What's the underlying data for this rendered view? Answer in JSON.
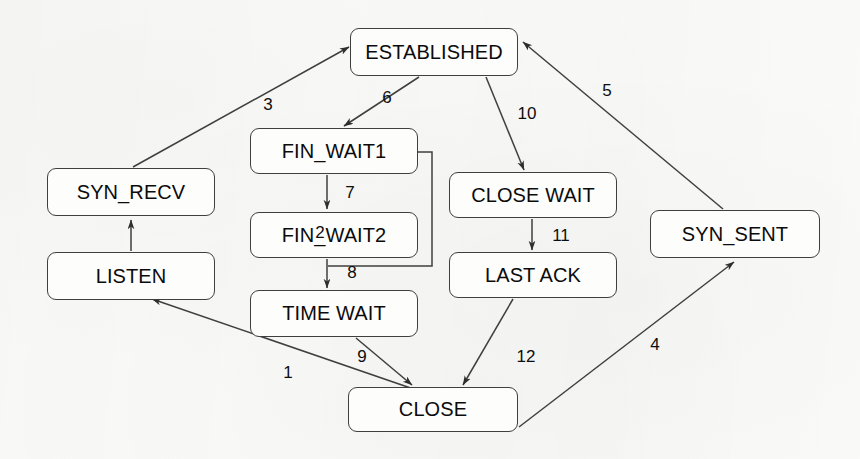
{
  "diagram": {
    "background_color": "#fafaf9",
    "line_color": "#3f3f3f",
    "text_color": "#0b0b0b",
    "states": [
      {
        "id": "established",
        "label": "ESTABLISHED",
        "x": 350,
        "y": 28,
        "w": 168,
        "h": 48
      },
      {
        "id": "syn_recv",
        "label": "SYN_RECV",
        "x": 47,
        "y": 168,
        "w": 168,
        "h": 48
      },
      {
        "id": "listen",
        "label": "LISTEN",
        "x": 47,
        "y": 252,
        "w": 168,
        "h": 48
      },
      {
        "id": "fin_wait1",
        "label": "FIN_WAIT1",
        "x": 250,
        "y": 128,
        "w": 168,
        "h": 46
      },
      {
        "id": "fin_wait2",
        "label": "FIN_WAIT2",
        "x": 250,
        "y": 212,
        "w": 168,
        "h": 46
      },
      {
        "id": "time_wait",
        "label": "TIME WAIT",
        "x": 250,
        "y": 290,
        "w": 168,
        "h": 47
      },
      {
        "id": "close_wait",
        "label": "CLOSE WAIT",
        "x": 449,
        "y": 172,
        "w": 168,
        "h": 46
      },
      {
        "id": "last_ack",
        "label": "LAST ACK",
        "x": 449,
        "y": 252,
        "w": 168,
        "h": 46
      },
      {
        "id": "syn_sent",
        "label": "SYN_SENT",
        "x": 650,
        "y": 210,
        "w": 170,
        "h": 48
      },
      {
        "id": "close",
        "label": "CLOSE",
        "x": 348,
        "y": 387,
        "w": 170,
        "h": 45
      }
    ],
    "transitions": [
      {
        "id": "t1",
        "label": "1",
        "from": "close",
        "to": "listen",
        "label_x": 288,
        "label_y": 372
      },
      {
        "id": "t2",
        "label": "2",
        "from": "listen",
        "to": "syn_recv",
        "label_x": 320,
        "label_y": 232
      },
      {
        "id": "t3",
        "label": "3",
        "from": "syn_recv",
        "to": "established",
        "label_x": 268,
        "label_y": 104
      },
      {
        "id": "t4",
        "label": "4",
        "from": "close",
        "to": "syn_sent",
        "label_x": 655,
        "label_y": 344
      },
      {
        "id": "t5",
        "label": "5",
        "from": "syn_sent",
        "to": "established",
        "label_x": 607,
        "label_y": 90
      },
      {
        "id": "t6",
        "label": "6",
        "from": "established",
        "to": "fin_wait1",
        "label_x": 387,
        "label_y": 97
      },
      {
        "id": "t7",
        "label": "7",
        "from": "fin_wait1",
        "to": "fin_wait2",
        "label_x": 350,
        "label_y": 192
      },
      {
        "id": "t8",
        "label": "8",
        "from": "fin_wait2",
        "to": "time_wait",
        "label_x": 352,
        "label_y": 272
      },
      {
        "id": "t9",
        "label": "9",
        "from": "time_wait",
        "to": "close",
        "label_x": 362,
        "label_y": 356
      },
      {
        "id": "t10",
        "label": "10",
        "from": "established",
        "to": "close_wait",
        "label_x": 527,
        "label_y": 113
      },
      {
        "id": "t11",
        "label": "11",
        "from": "close_wait",
        "to": "last_ack",
        "label_x": 561,
        "label_y": 235
      },
      {
        "id": "t12",
        "label": "12",
        "from": "last_ack",
        "to": "close",
        "label_x": 526,
        "label_y": 356
      }
    ],
    "label_positions_note": "numeric edge labels",
    "edge_geometry": {
      "t1": "M 428,394 L 152,299",
      "t2": "M 131,251 L 131,219",
      "t3": "M 133,167 L 349,47",
      "t4": "M 519,427 L 733,262",
      "t5": "M 722,208 L 524,43",
      "t6": "M 420,77 L 345,125",
      "t7": "M 327,176 L 327,208",
      "t8": "M 327,260 L 327,287",
      "t9": "M 357,339 L 411,384",
      "t10": "M 486,78 L 524,169",
      "t11": "M 532,220 L 532,249",
      "t12": "M 512,300 L 462,384",
      "bracket": "M 418,152 L 432,152 L 432,266 L 327,266"
    }
  }
}
